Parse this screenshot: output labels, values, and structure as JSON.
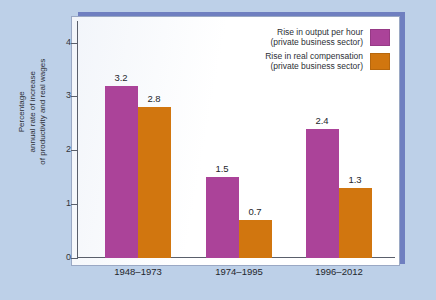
{
  "chart_data": {
    "type": "bar",
    "title": "",
    "subtitle": "",
    "xlabel": "",
    "ylabel": "Percentage\nannual rate of increase\nof productivity and real wages",
    "categories": [
      "1948–1973",
      "1974–1995",
      "1996–2012"
    ],
    "series": [
      {
        "name": "Rise in output per hour\n(private business sector)",
        "color": "#ab4399",
        "values": [
          3.2,
          1.5,
          2.4
        ],
        "value_labels": [
          "3.2",
          "1.5",
          "2.4"
        ]
      },
      {
        "name": "Rise in real compensation\n(private business sector)",
        "color": "#d1760f",
        "values": [
          2.8,
          0.7,
          1.3
        ],
        "value_labels": [
          "2.8",
          "0.7",
          "1.3"
        ]
      }
    ],
    "ylim": [
      0,
      4.4
    ],
    "yticks": [
      0,
      1,
      2,
      3,
      4
    ],
    "ytick_labels": [
      "0",
      "1",
      "2",
      "3",
      "4"
    ],
    "grid": false,
    "legend_position": "top-right"
  },
  "legend": {
    "entries": [
      {
        "label": "Rise in output per hour\n(private business sector)",
        "swatch_color": "#ab4399"
      },
      {
        "label": "Rise in real compensation\n(private business sector)",
        "swatch_color": "#d1760f"
      }
    ]
  },
  "axes": {
    "y_title": "Percentage\nannual rate of increase\nof productivity and real wages",
    "y_tick_labels": [
      "4",
      "3",
      "2",
      "1",
      "0"
    ],
    "x_tick_labels": [
      "1948–1973",
      "1974–1995",
      "1996–2012"
    ]
  },
  "colors": {
    "page_background": "#bdd0e8",
    "plot_background": "#ffffff",
    "frame_shadow": "#6f7fc0",
    "series_1": "#ab4399",
    "series_2": "#d1760f",
    "axis": "#5a5f6b",
    "text": "#24262c"
  }
}
